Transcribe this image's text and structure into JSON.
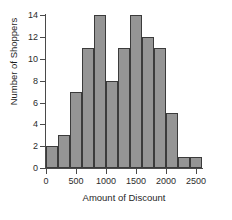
{
  "chart_data": {
    "type": "bar",
    "chart_subtype": "histogram",
    "title": "",
    "xlabel": "Amount of Discount",
    "ylabel": "Number of Shoppers",
    "bin_width": 200,
    "bin_edges": [
      0,
      200,
      400,
      600,
      800,
      1000,
      1200,
      1400,
      1600,
      1800,
      2000,
      2200,
      2400,
      2600
    ],
    "categories": [
      "0-200",
      "200-400",
      "400-600",
      "600-800",
      "800-1000",
      "1000-1200",
      "1200-1400",
      "1400-1600",
      "1600-1800",
      "1800-2000",
      "2000-2200",
      "2200-2400",
      "2400-2600"
    ],
    "values": [
      2,
      3,
      7,
      11,
      14,
      8,
      11,
      14,
      12,
      11,
      5,
      1,
      1
    ],
    "xlim": [
      0,
      2600
    ],
    "ylim": [
      0,
      14
    ],
    "xticks": [
      0,
      500,
      1000,
      1500,
      2000,
      2500
    ],
    "xtick_labels": [
      "0",
      "500",
      "1000",
      "1500",
      "2000",
      "2500"
    ],
    "yticks": [
      0,
      2,
      4,
      6,
      8,
      10,
      12,
      14
    ],
    "ytick_labels": [
      "0",
      "2",
      "4",
      "6",
      "8",
      "10",
      "12",
      "14"
    ],
    "grid": false,
    "legend": null,
    "bar_fill_color": "#959595",
    "bar_edge_color": "#3b3b3b",
    "axis_color": "#4a4a4a",
    "background_color": "#ffffff"
  }
}
